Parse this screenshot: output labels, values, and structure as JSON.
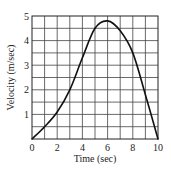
{
  "chart_data": {
    "type": "line",
    "title": "",
    "xlabel": "Time (sec)",
    "ylabel": "Velocity (m/sec)",
    "xlim": [
      0,
      10
    ],
    "ylim": [
      0,
      5
    ],
    "grid": true,
    "x_grid_step": 1,
    "y_grid_step": 0.5,
    "x_ticks": [
      0,
      2,
      4,
      6,
      8,
      10
    ],
    "x_tick_labels": [
      "0",
      "2",
      "4",
      "6",
      "8",
      "10"
    ],
    "y_ticks": [
      1,
      2,
      3,
      4,
      5
    ],
    "y_tick_labels": [
      "1",
      "2",
      "3",
      "4",
      "5"
    ],
    "legend": null,
    "series": [
      {
        "name": "velocity",
        "x": [
          0,
          1,
          2,
          3,
          4,
          5,
          6,
          7,
          8,
          9,
          10
        ],
        "values": [
          0,
          0.5,
          1.1,
          2.0,
          3.3,
          4.5,
          4.8,
          4.4,
          3.5,
          1.8,
          0
        ]
      }
    ]
  },
  "colors": {
    "curve": "#111111",
    "grid": "#444444",
    "background": "#ffffff"
  }
}
